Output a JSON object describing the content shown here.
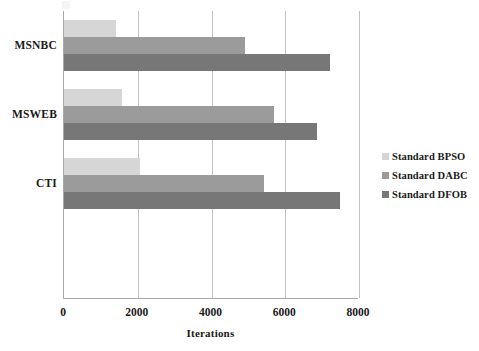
{
  "chart_data": {
    "type": "bar",
    "orientation": "horizontal",
    "title": "",
    "subtitle": "",
    "xlabel": "Iterations",
    "ylabel": "",
    "categories": [
      "MSNBC",
      "MSWEB",
      "CTI"
    ],
    "series": [
      {
        "name": "Standard BPSO",
        "color": "#d6d6d6",
        "values": [
          1420,
          1580,
          2050
        ]
      },
      {
        "name": "Standard DABC",
        "color": "#9b9b9b",
        "values": [
          4900,
          5700,
          5430
        ]
      },
      {
        "name": "Standard DFOB",
        "color": "#777777",
        "values": [
          7200,
          6870,
          7480
        ]
      }
    ],
    "xlim": [
      0,
      8000
    ],
    "xticks": [
      0,
      2000,
      4000,
      6000,
      8000
    ],
    "xtick_labels": [
      "0",
      "2000",
      "4000",
      "6000",
      "8000"
    ],
    "grid": {
      "vertical": true,
      "horizontal": false,
      "color": "#c2c2c2"
    },
    "legend": {
      "position": "right",
      "entries": [
        {
          "label": "Standard BPSO",
          "color": "#d6d6d6"
        },
        {
          "label": "Standard DABC",
          "color": "#9b9b9b"
        },
        {
          "label": "Standard DFOB",
          "color": "#777777"
        }
      ]
    },
    "axis_color": "#a8a8a8",
    "background": "#ffffff"
  }
}
